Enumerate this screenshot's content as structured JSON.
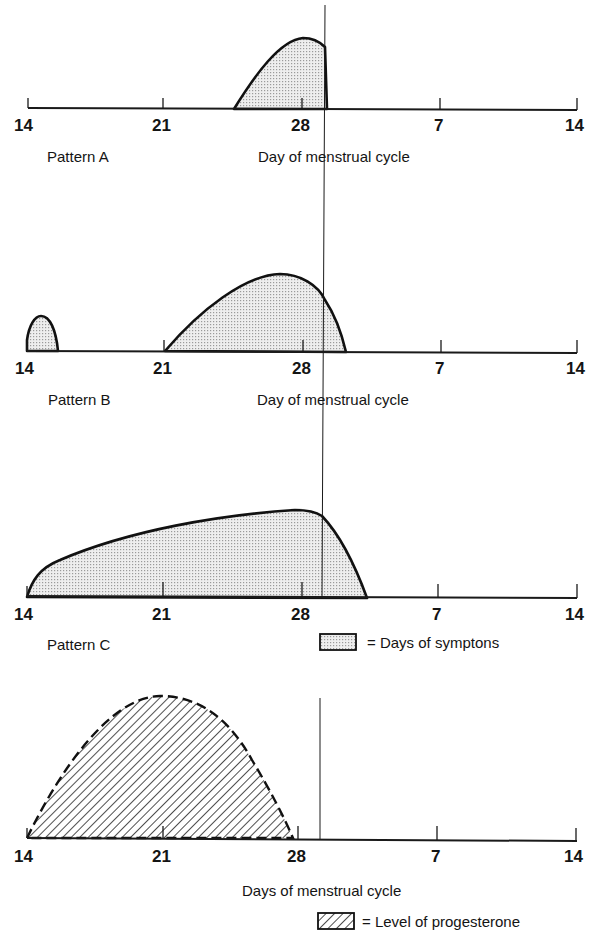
{
  "figure": {
    "x_axis_ticks": [
      "14",
      "21",
      "28",
      "7",
      "14"
    ],
    "panels": [
      {
        "id": "pattern-a",
        "pattern_label": "Pattern A",
        "axis_label": "Day of menstrual cycle",
        "curve_type": "symptoms",
        "description": "Symptoms start ~day 25, peak ~day 28, end abruptly at onset of menstruation"
      },
      {
        "id": "pattern-b",
        "pattern_label": "Pattern B",
        "axis_label": "Day of menstrual cycle",
        "curve_type": "symptoms",
        "description": "Brief symptoms at ovulation (~day 14-15), then symptoms from ~day 21 peaking ~day 27, ending ~day 2 of next cycle"
      },
      {
        "id": "pattern-c",
        "pattern_label": "Pattern C",
        "axis_label": "",
        "curve_type": "symptoms",
        "description": "Symptoms rise from day 14 to peak ~day 28, ending ~day 3 of next cycle"
      },
      {
        "id": "progesterone",
        "pattern_label": "",
        "axis_label": "Days of menstrual cycle",
        "curve_type": "progesterone",
        "description": "Progesterone rises from day 14, peaks ~day 21, falls to baseline ~day 28"
      }
    ],
    "legend": {
      "symptoms": "= Days of symptons",
      "progesterone": "= Level of progesterone"
    }
  },
  "colors": {
    "ink": "#111111",
    "background": "#ffffff",
    "dot_fill": "#d9d9d9"
  }
}
